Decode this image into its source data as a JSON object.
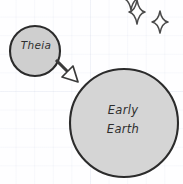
{
  "diagram": {
    "style": "hand-drawn sketch on graph paper",
    "background": {
      "paper_color": "#fefeff",
      "grid_color": "#eceef5"
    },
    "bodies": [
      {
        "id": "theia",
        "name": "theia-circle",
        "label": "Theia",
        "cx": 35,
        "cy": 51,
        "r": 25,
        "fill": "#cfcfcf",
        "stroke": "#2b2b2b"
      },
      {
        "id": "early-earth",
        "name": "early-earth-circle",
        "label_line1": "Early",
        "label_line2": "Earth",
        "cx": 124,
        "cy": 123,
        "r": 54,
        "fill": "#d5d5d5",
        "stroke": "#2b2b2b"
      }
    ],
    "arrow": {
      "name": "impact-arrow",
      "direction": "down-right",
      "from": "theia",
      "to": "early-earth",
      "fill": "#ffffff",
      "stroke": "#3a3a3a"
    },
    "sparkles": [
      {
        "name": "sparkle-top-clipped",
        "cx": 131,
        "cy": -2,
        "rx": 9,
        "ry": 12
      },
      {
        "name": "sparkle-upper",
        "cx": 137,
        "cy": 12,
        "rx": 8,
        "ry": 12
      },
      {
        "name": "sparkle-right",
        "cx": 160,
        "cy": 22,
        "rx": 8,
        "ry": 11
      }
    ]
  }
}
